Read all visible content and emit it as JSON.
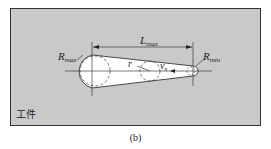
{
  "diagram": {
    "labels": {
      "r_max": "R",
      "r_max_sub": "max",
      "l_max": "L",
      "l_max_sub": "max",
      "r_min": "R",
      "r_min_sub": "min",
      "r": "r",
      "v": "v",
      "v_sub": "s",
      "workpiece": "工件"
    },
    "caption": "(b)",
    "colors": {
      "panel": "#c9c9c9",
      "shape": "#ffffff",
      "line": "#222222"
    }
  }
}
